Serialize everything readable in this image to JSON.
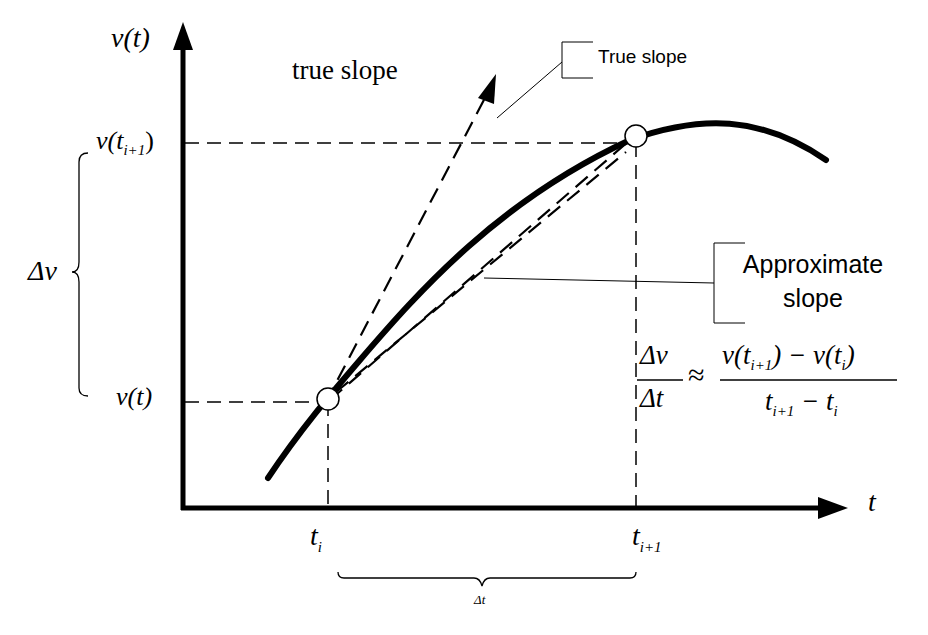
{
  "diagram": {
    "axes": {
      "y_label": "v(t)",
      "x_label": "t"
    },
    "labels": {
      "true_slope_top": "true slope",
      "true_slope_callout": "True slope",
      "approx_line1": "Approximate",
      "approx_line2": "slope",
      "v_ti1_main": "v(t",
      "v_ti1_sub": "i+1",
      "v_ti1_close": ")",
      "v_t": "v(t)",
      "delta_v": "Δv",
      "t_i_main": "t",
      "t_i_sub": "i",
      "t_i1_main": "t",
      "t_i1_sub": "i+1",
      "delta_t": "Δt"
    },
    "formula": {
      "lhs_num": "Δv",
      "lhs_den": "Δt",
      "approx": "≈",
      "rhs_num": "v(t_{i+1}) − v(t_i)",
      "rhs_den": "t_{i+1} − t_i"
    },
    "colors": {
      "ink": "#000000",
      "background": "#ffffff"
    }
  }
}
